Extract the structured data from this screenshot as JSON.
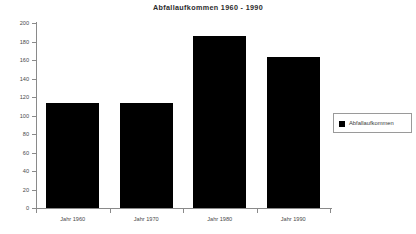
{
  "chart_data": {
    "type": "bar",
    "title": "Abfallaufkommen 1960 - 1990",
    "xlabel": "",
    "ylabel": "",
    "categories": [
      "Jahr 1960",
      "Jahr 1970",
      "Jahr 1980",
      "Jahr 1990"
    ],
    "values": [
      114,
      113,
      186,
      163
    ],
    "series": [
      {
        "name": "Abfallaufkommen",
        "values": [
          114,
          113,
          186,
          163
        ],
        "color": "#000000"
      }
    ],
    "ylim": [
      0,
      200
    ],
    "ytick_labels": [
      "200",
      "180",
      "160",
      "140",
      "120",
      "100",
      "80",
      "60",
      "40",
      "20",
      "0"
    ],
    "ytick_values": [
      200,
      180,
      160,
      140,
      120,
      100,
      80,
      60,
      40,
      20,
      0
    ],
    "grid": false,
    "legend_position": "right",
    "legend_entries": [
      "Abfallaufkommen"
    ],
    "axis_color": "#8a8a8a",
    "background": "#ffffff"
  },
  "legend": {
    "label": "Abfallaufkommen"
  }
}
